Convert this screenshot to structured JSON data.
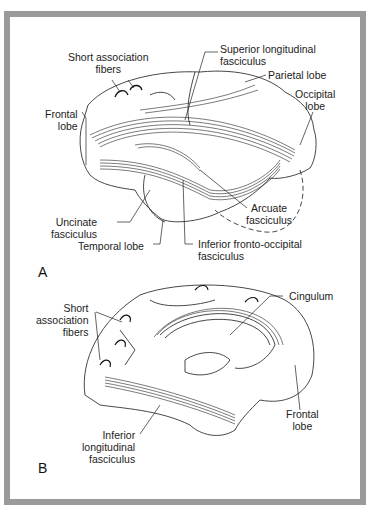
{
  "figure": {
    "panels": [
      {
        "id": "A",
        "view": "lateral",
        "labels": {
          "short_assoc": [
            "Short association",
            "fibers"
          ],
          "slf": [
            "Superior longitudinal",
            "fasciculus"
          ],
          "parietal": "Parietal lobe",
          "occipital": [
            "Occipital",
            "lobe"
          ],
          "frontal": [
            "Frontal",
            "lobe"
          ],
          "uncinate": [
            "Uncinate",
            "fasciculus"
          ],
          "temporal": "Temporal lobe",
          "arcuate": [
            "Arcuate",
            "fasciculus"
          ],
          "ifof": [
            "Inferior fronto-occipital",
            "fasciculus"
          ]
        }
      },
      {
        "id": "B",
        "view": "medial",
        "labels": {
          "short_assoc": [
            "Short",
            "association",
            "fibers"
          ],
          "cingulum": "Cingulum",
          "frontal": [
            "Frontal",
            "lobe"
          ],
          "ilf": [
            "Inferior",
            "longitudinal",
            "fasciculus"
          ]
        }
      }
    ],
    "frame_color": "#9a9a9a"
  }
}
